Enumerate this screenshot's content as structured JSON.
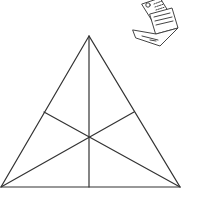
{
  "diagram": {
    "type": "triangle-medians",
    "stroke_color": "#333333",
    "background": "#ffffff",
    "vertices": {
      "apex": [
        89,
        36
      ],
      "bottom_left": [
        1,
        187
      ],
      "bottom_right": [
        180,
        187
      ]
    },
    "side_midpoints": {
      "left": [
        44,
        112
      ],
      "right": [
        134,
        112
      ],
      "bottom": [
        89,
        187
      ]
    },
    "centroid": [
      89,
      136
    ],
    "segments_count": 6
  },
  "icon": {
    "name": "laptop-documents-icon",
    "stroke_color": "#444444"
  }
}
